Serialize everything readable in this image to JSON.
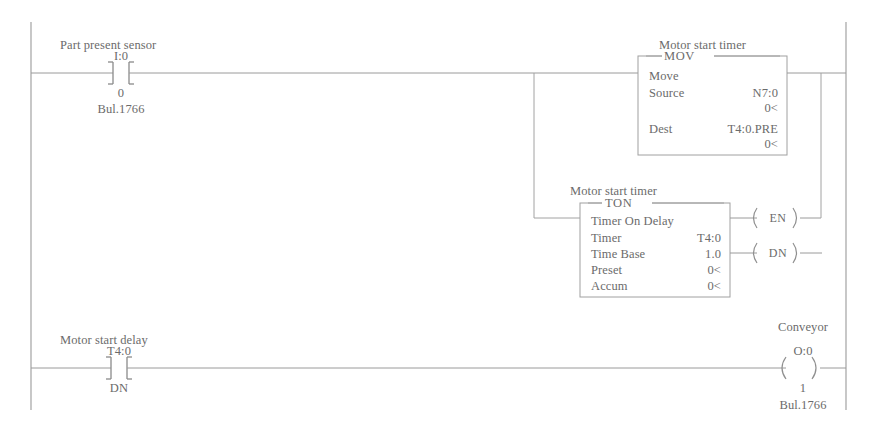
{
  "diagram": {
    "type": "ladder-logic",
    "title_visible": false,
    "line_color": "#9a9a9a",
    "text_color": "#6b6b6b",
    "background": "#ffffff"
  },
  "rungs": [
    {
      "id": "rung-1",
      "comment": "Part present sensor",
      "contact": {
        "type": "examine-if-closed",
        "address": "I:0",
        "bit": "0",
        "module": "Bul.1766"
      },
      "instructions": [
        {
          "id": "mov-block",
          "comment": "Motor start timer",
          "mnemonic": "MOV",
          "description": "Move",
          "operands": [
            {
              "label": "Source",
              "value": "N7:0",
              "current": "0<"
            },
            {
              "label": "Dest",
              "value": "T4:0.PRE",
              "current": "0<"
            }
          ]
        }
      ]
    },
    {
      "id": "rung-2-branch",
      "instructions": [
        {
          "id": "ton-block",
          "comment": "Motor start timer",
          "mnemonic": "TON",
          "description": "Timer On Delay",
          "operands": [
            {
              "label": "Timer",
              "value": "T4:0"
            },
            {
              "label": "Time Base",
              "value": "1.0"
            },
            {
              "label": "Preset",
              "value": "0<"
            },
            {
              "label": "Accum",
              "value": "0<"
            }
          ],
          "outputs": [
            {
              "label": "EN"
            },
            {
              "label": "DN"
            }
          ]
        }
      ]
    },
    {
      "id": "rung-3",
      "comment": "Motor start delay",
      "contact": {
        "type": "examine-if-closed",
        "address": "T4:0",
        "bit": "DN"
      },
      "coil": {
        "comment": "Conveyor",
        "address": "O:0",
        "bit": "1",
        "module": "Bul.1766"
      }
    }
  ]
}
